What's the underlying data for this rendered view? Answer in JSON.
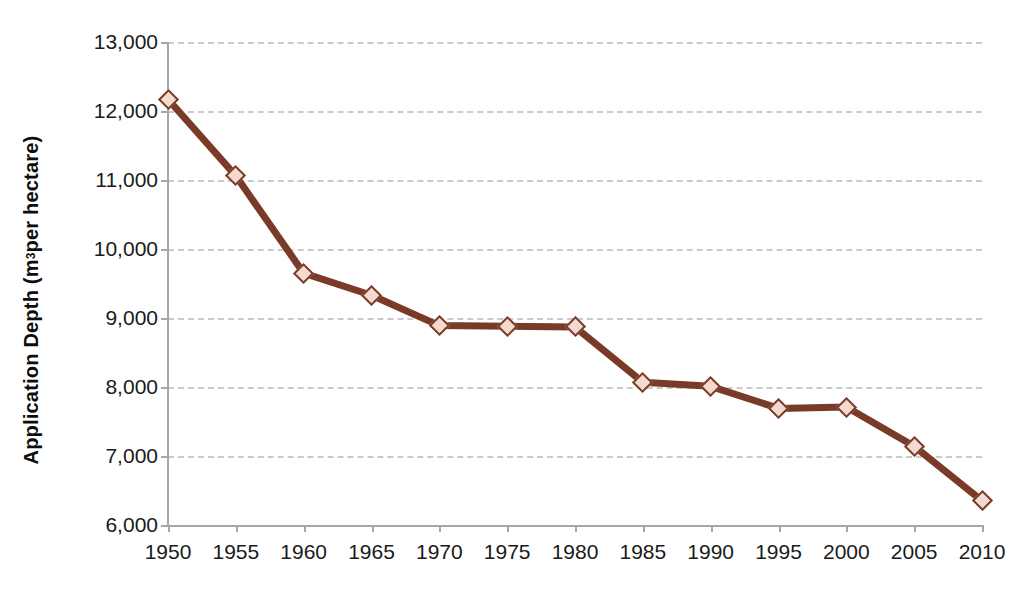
{
  "chart_data": {
    "type": "line",
    "title": "",
    "xlabel": "",
    "ylabel": "Application Depth (m³ per hectare)",
    "ylabel_parts": {
      "main": "Application Depth (m",
      "sup": "3",
      "tail": " per hectare)"
    },
    "categories": [
      1950,
      1955,
      1960,
      1965,
      1970,
      1975,
      1980,
      1985,
      1990,
      1995,
      2000,
      2005,
      2010
    ],
    "x_tick_labels": [
      "1950",
      "1955",
      "1960",
      "1965",
      "1970",
      "1975",
      "1980",
      "1985",
      "1990",
      "1995",
      "2000",
      "2005",
      "2010"
    ],
    "values": [
      12170,
      11060,
      9650,
      9330,
      8890,
      8880,
      8870,
      8070,
      8010,
      7690,
      7710,
      7140,
      6350
    ],
    "y_ticks": [
      6000,
      7000,
      8000,
      9000,
      10000,
      11000,
      12000,
      13000
    ],
    "y_tick_labels": [
      "6,000",
      "7,000",
      "8,000",
      "9,000",
      "10,000",
      "11,000",
      "12,000",
      "13,000"
    ],
    "ylim": [
      6000,
      13000
    ],
    "xlim": [
      1950,
      2010
    ],
    "grid": true,
    "grid_style": "dashed-horizontal",
    "legend": false,
    "series_name": "Application Depth",
    "colors": {
      "line": "#7a3a28",
      "marker_fill": "#f3d9ce",
      "marker_edge": "#7a3a28",
      "gridline": "#c9c9cf",
      "axis": "#a6a6a6",
      "text": "#1a1a1a",
      "background": "#ffffff"
    }
  }
}
